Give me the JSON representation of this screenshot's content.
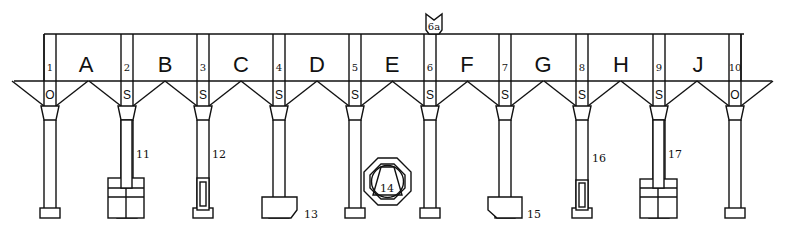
{
  "diagram": {
    "top_label": "6a",
    "bays": [
      {
        "letter": "A"
      },
      {
        "letter": "B"
      },
      {
        "letter": "C"
      },
      {
        "letter": "D"
      },
      {
        "letter": "E"
      },
      {
        "letter": "F"
      },
      {
        "letter": "G"
      },
      {
        "letter": "H"
      },
      {
        "letter": "J"
      }
    ],
    "columns": [
      {
        "number": "1",
        "hopper": "O"
      },
      {
        "number": "2",
        "hopper": "S"
      },
      {
        "number": "3",
        "hopper": "S"
      },
      {
        "number": "4",
        "hopper": "S"
      },
      {
        "number": "5",
        "hopper": "S"
      },
      {
        "number": "6",
        "hopper": "S"
      },
      {
        "number": "7",
        "hopper": "S"
      },
      {
        "number": "8",
        "hopper": "S"
      },
      {
        "number": "9",
        "hopper": "S"
      },
      {
        "number": "10",
        "hopper": "O"
      }
    ],
    "details": {
      "d11": "11",
      "d12": "12",
      "d13": "13",
      "d14": "14",
      "d15": "15",
      "d16": "16",
      "d17": "17"
    }
  }
}
